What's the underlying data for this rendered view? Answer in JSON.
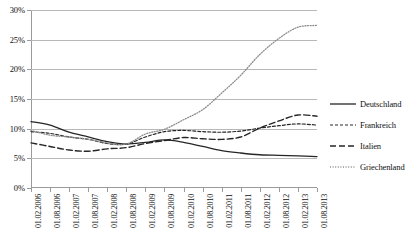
{
  "chart_data": {
    "type": "line",
    "title": "",
    "xlabel": "",
    "ylabel": "",
    "ylim": [
      0,
      30
    ],
    "ytick_labels": [
      "0%",
      "5%",
      "10%",
      "15%",
      "20%",
      "25%",
      "30%"
    ],
    "ytick_values": [
      0,
      5,
      10,
      15,
      20,
      25,
      30
    ],
    "grid": true,
    "legend_position": "right",
    "categories": [
      "01.02.2006",
      "01.08.2006",
      "01.02.2007",
      "01.08.2007",
      "01.02.2008",
      "01.08.2008",
      "01.02.2009",
      "01.08.2009",
      "01.02.2010",
      "01.08.2010",
      "01.02.2011",
      "01.08.2011",
      "01.02.2012",
      "01.08.2012",
      "01.02.2013",
      "01.08.2013"
    ],
    "series": [
      {
        "name": "Deutschland",
        "style": "solid",
        "color": "#262626",
        "values": [
          11.2,
          10.6,
          9.4,
          8.6,
          7.8,
          7.4,
          7.7,
          8.1,
          7.7,
          7.0,
          6.3,
          5.9,
          5.6,
          5.5,
          5.4,
          5.3
        ]
      },
      {
        "name": "Frankreich",
        "style": "dashed",
        "color": "#262626",
        "values": [
          9.5,
          9.2,
          8.6,
          8.2,
          7.5,
          7.4,
          8.6,
          9.5,
          9.7,
          9.5,
          9.4,
          9.6,
          10.1,
          10.5,
          10.8,
          10.6
        ]
      },
      {
        "name": "Italien",
        "style": "dash-long",
        "color": "#262626",
        "values": [
          7.6,
          7.0,
          6.4,
          6.2,
          6.6,
          6.8,
          7.5,
          8.0,
          8.5,
          8.3,
          8.2,
          8.6,
          10.1,
          11.3,
          12.3,
          12.1
        ]
      },
      {
        "name": "Griechenland",
        "style": "dotted",
        "color": "#8c8c8c",
        "values": [
          9.7,
          8.9,
          8.6,
          8.2,
          7.6,
          7.4,
          9.1,
          9.9,
          11.5,
          13.2,
          16.0,
          19.0,
          22.5,
          25.2,
          27.1,
          27.4
        ]
      }
    ]
  }
}
